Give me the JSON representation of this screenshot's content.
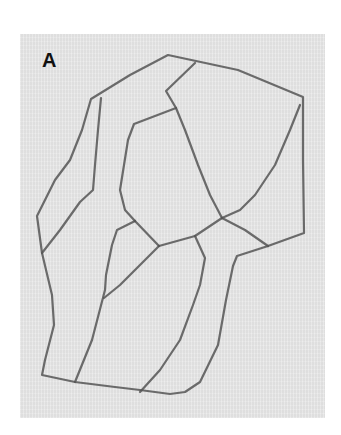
{
  "figure": {
    "panel_label": "A",
    "background_color": "#ffffff",
    "panel_color": "#e6e6e6",
    "stroke_color": "#555555"
  }
}
